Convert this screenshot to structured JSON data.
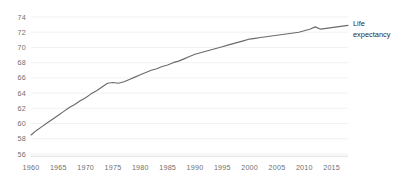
{
  "chart_data": {
    "type": "line",
    "title": "",
    "subtitle": "",
    "xlabel": "",
    "ylabel": "",
    "xlim": [
      1960,
      2018
    ],
    "ylim": [
      56,
      75
    ],
    "grid": "horizontal",
    "legend_position": "right-inline",
    "x_ticks": [
      "1960",
      "1965",
      "1970",
      "1975",
      "1980",
      "1985",
      "1990",
      "1995",
      "2000",
      "2005",
      "2010",
      "2015"
    ],
    "y_ticks": [
      "56",
      "58",
      "60",
      "62",
      "64",
      "66",
      "68",
      "70",
      "72",
      "74"
    ],
    "series": [
      {
        "name": "Life expectancy",
        "label_line1": "Life",
        "label_line2": "expectancy",
        "color": "#6b6b6b",
        "x": [
          1960,
          1961,
          1962,
          1963,
          1964,
          1965,
          1966,
          1967,
          1968,
          1969,
          1970,
          1971,
          1972,
          1973,
          1974,
          1975,
          1976,
          1977,
          1978,
          1979,
          1980,
          1981,
          1982,
          1983,
          1984,
          1985,
          1986,
          1987,
          1988,
          1989,
          1990,
          1991,
          1992,
          1993,
          1994,
          1995,
          1996,
          1997,
          1998,
          1999,
          2000,
          2001,
          2002,
          2003,
          2004,
          2005,
          2006,
          2007,
          2008,
          2009,
          2010,
          2011,
          2012,
          2013,
          2014,
          2015,
          2016,
          2017,
          2018
        ],
        "values": [
          58.5,
          59.1,
          59.6,
          60.1,
          60.6,
          61.1,
          61.6,
          62.1,
          62.5,
          63.0,
          63.4,
          63.9,
          64.3,
          64.8,
          65.3,
          65.4,
          65.3,
          65.5,
          65.8,
          66.1,
          66.4,
          66.7,
          67.0,
          67.2,
          67.5,
          67.7,
          68.0,
          68.2,
          68.5,
          68.8,
          69.1,
          69.3,
          69.5,
          69.7,
          69.9,
          70.1,
          70.3,
          70.5,
          70.7,
          70.9,
          71.1,
          71.2,
          71.3,
          71.4,
          71.5,
          71.6,
          71.7,
          71.8,
          71.9,
          72.0,
          72.2,
          72.4,
          72.7,
          72.4,
          72.5,
          72.6,
          72.7,
          72.8,
          72.9
        ]
      }
    ]
  },
  "colors": {
    "line": "#6b6b6b",
    "grid": "#eceef0",
    "axis": "#d9dbdd",
    "tick_text": "#6f6f6f",
    "label_text": "#2b2b2b",
    "background": "#ffffff"
  }
}
